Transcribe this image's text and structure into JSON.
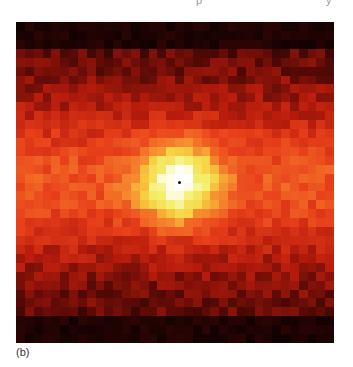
{
  "page": {
    "top_text_fragments": [
      "",
      "p",
      "y"
    ],
    "panel_label": "(b)"
  },
  "figure": {
    "type": "intensity-image",
    "colormap": [
      "#000000",
      "#5a0a06",
      "#b81c0c",
      "#e8401a",
      "#f57a2a",
      "#f8d040",
      "#f4f070",
      "#ffffff"
    ],
    "grid_cols": 36,
    "grid_rows": 36,
    "peak": {
      "x": 0.51,
      "y": 0.5,
      "radius": 0.12
    },
    "center_marker": true
  }
}
